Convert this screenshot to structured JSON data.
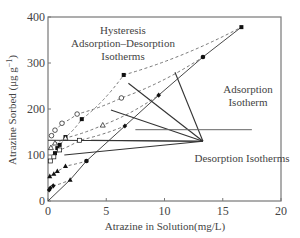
{
  "chart_data": {
    "type": "scatter",
    "title": "",
    "xlabel": "Atrazine in Solution(mg/L)",
    "ylabel": "Atrazine Sorbed (μg g",
    "ylabel_sup": "−1",
    "ylabel_close": ")",
    "xlim": [
      0,
      20
    ],
    "ylim": [
      0,
      400
    ],
    "xticks": [
      0,
      5,
      10,
      15,
      20
    ],
    "yticks": [
      0,
      100,
      200,
      300,
      400
    ],
    "grid": false,
    "colors": {
      "axis": "#777777",
      "line": "#333333",
      "marker": "#111111",
      "text": "#444444"
    },
    "annotations": [
      {
        "name": "hysteresis",
        "lines": [
          "Hysteresis",
          "Adsorption–Desorption",
          "Isotherms"
        ]
      },
      {
        "name": "adsorption",
        "lines": [
          "Adsorption",
          "Isotherm"
        ]
      },
      {
        "name": "desorption",
        "lines": [
          "Desorption Isotherms"
        ]
      }
    ],
    "adsorption_isotherm": {
      "name": "Adsorption Isotherm",
      "x": [
        0,
        1.9,
        3.3,
        6.6,
        9.5,
        13.3,
        16.6
      ],
      "y": [
        0,
        46,
        87,
        163,
        230,
        313,
        378
      ]
    },
    "series": [
      {
        "name": "Desorption 1",
        "marker": "filled-square",
        "x": [
          0.6,
          0.8,
          1.0,
          1.5,
          2.9,
          6.5,
          16.6
        ],
        "y": [
          104,
          115,
          122,
          139,
          178,
          274,
          378
        ]
      },
      {
        "name": "Desorption 2",
        "marker": "open-circle",
        "x": [
          0.3,
          0.6,
          1.2,
          2.5,
          6.3,
          13.3
        ],
        "y": [
          142,
          154,
          169,
          189,
          224,
          313
        ]
      },
      {
        "name": "Desorption 3",
        "marker": "open-triangle",
        "x": [
          0.25,
          0.6,
          1.5,
          4.7,
          9.5
        ],
        "y": [
          116,
          126,
          137,
          165,
          230
        ]
      },
      {
        "name": "Desorption 4",
        "marker": "open-square",
        "x": [
          0.2,
          0.5,
          1.0,
          2.7,
          6.6
        ],
        "y": [
          87,
          96,
          111,
          132,
          163
        ]
      },
      {
        "name": "Desorption 5",
        "marker": "filled-triangle",
        "x": [
          0.15,
          0.5,
          0.8,
          1.5,
          3.3
        ],
        "y": [
          54,
          59,
          65,
          76,
          87
        ]
      },
      {
        "name": "Desorption 6",
        "marker": "filled-diamond",
        "x": [
          0.1,
          0.2,
          0.45,
          1.9
        ],
        "y": [
          24,
          28,
          33,
          46
        ]
      }
    ],
    "desorption_leaders": {
      "target": [
        13.3,
        130
      ],
      "from": [
        [
          10.9,
          280
        ],
        [
          6.9,
          256
        ],
        [
          5.4,
          198
        ],
        [
          3.7,
          132
        ],
        [
          0,
          132
        ],
        [
          1.4,
          100
        ]
      ]
    },
    "adsorption_leader": {
      "from": [
        7.5,
        155
      ],
      "to": [
        17.5,
        155
      ]
    }
  }
}
